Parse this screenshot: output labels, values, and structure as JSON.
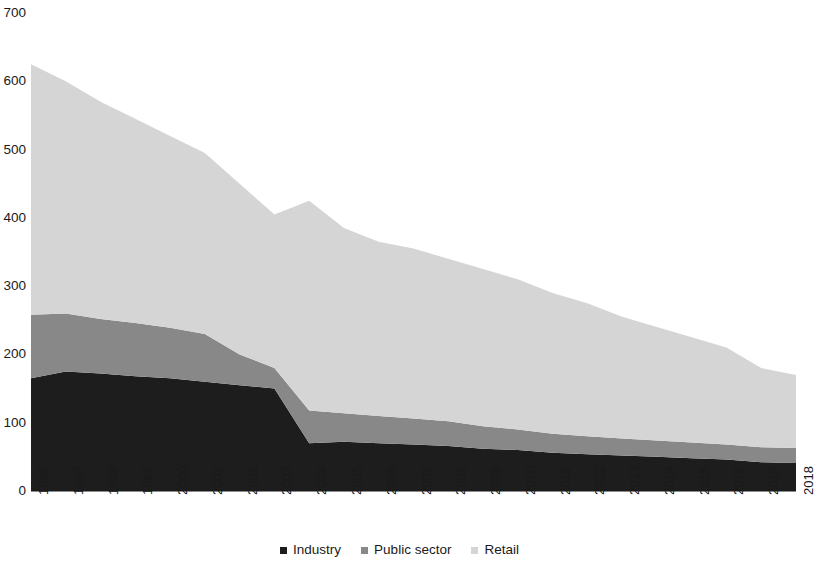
{
  "chart_data": {
    "type": "area",
    "stacked": true,
    "title": "",
    "subtitle": "",
    "xlabel": "",
    "ylabel": "",
    "grid": false,
    "legend_position": "bottom-center",
    "ylim": [
      0,
      700
    ],
    "y_ticks": [
      700,
      600,
      500,
      400,
      300,
      200,
      100,
      0
    ],
    "categories": [
      "1996",
      "1997",
      "1998",
      "1999",
      "2000",
      "2001",
      "2002",
      "2003",
      "2004",
      "2005",
      "2006",
      "2007",
      "2008",
      "2009",
      "2010",
      "2011",
      "2012",
      "2013",
      "2014",
      "2015",
      "2016",
      "2017",
      "2018"
    ],
    "series": [
      {
        "name": "Industry",
        "color": "#1d1d1d",
        "values": [
          165,
          175,
          172,
          168,
          165,
          160,
          155,
          150,
          70,
          72,
          70,
          68,
          66,
          62,
          60,
          56,
          54,
          52,
          50,
          48,
          46,
          42,
          41
        ]
      },
      {
        "name": "Public sector",
        "color": "#888888",
        "values": [
          93,
          85,
          80,
          78,
          74,
          70,
          45,
          30,
          48,
          42,
          40,
          38,
          36,
          33,
          30,
          28,
          26,
          25,
          24,
          23,
          22,
          22,
          22
        ]
      },
      {
        "name": "Retail",
        "color": "#d5d5d5",
        "values": [
          367,
          340,
          318,
          299,
          281,
          265,
          250,
          225,
          307,
          271,
          255,
          249,
          238,
          230,
          220,
          206,
          195,
          178,
          166,
          154,
          142,
          116,
          107
        ]
      }
    ],
    "totals": [
      625,
      600,
      570,
      545,
      520,
      495,
      450,
      405,
      425,
      385,
      365,
      355,
      340,
      325,
      310,
      290,
      275,
      255,
      240,
      225,
      210,
      180,
      170
    ]
  },
  "legend": {
    "items": [
      {
        "label": "Industry",
        "color": "#1d1d1d"
      },
      {
        "label": "Public sector",
        "color": "#888888"
      },
      {
        "label": "Retail",
        "color": "#d5d5d5"
      }
    ]
  }
}
